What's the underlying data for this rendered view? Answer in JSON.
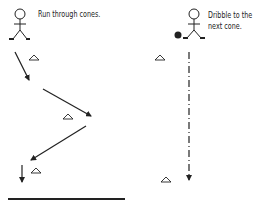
{
  "drills": [
    {
      "id": "left",
      "caption": "Run through cones."
    },
    {
      "id": "right",
      "caption_line1": "Dribble to the",
      "caption_line2": "next cone."
    }
  ],
  "colors": {
    "ink": "#222222",
    "background": "#ffffff"
  }
}
